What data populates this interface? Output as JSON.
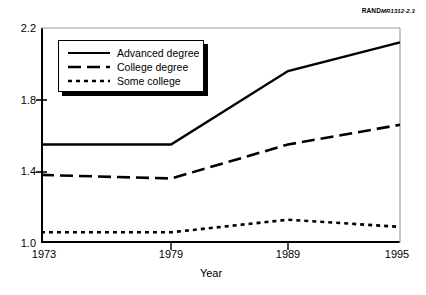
{
  "source_tag": {
    "brand": "RAND",
    "number": "MR1312-2.3"
  },
  "axes": {
    "y_title": "",
    "y_ticks": [
      "1.0",
      "1.4",
      "1.8",
      "2.2"
    ],
    "x_title": "Year",
    "x_ticks": [
      "1973",
      "1979",
      "1989",
      "1995"
    ]
  },
  "legend": {
    "entries": [
      {
        "label": "Advanced degree",
        "style": "solid"
      },
      {
        "label": "College degree",
        "style": "dashed"
      },
      {
        "label": "Some college",
        "style": "dotted"
      }
    ]
  },
  "chart_data": {
    "type": "line",
    "title": "",
    "xlabel": "Year",
    "ylabel": "",
    "x": [
      "1973",
      "1979",
      "1989",
      "1995"
    ],
    "categories": [
      "1973",
      "1979",
      "1989",
      "1995"
    ],
    "ylim": [
      1.0,
      2.2
    ],
    "yticks": [
      1.0,
      1.4,
      1.8,
      2.2
    ],
    "grid": false,
    "legend_position": "upper-left-inside",
    "x_spacing": "categorical-uneven",
    "series": [
      {
        "name": "Advanced degree",
        "style": "solid",
        "values": [
          1.55,
          1.55,
          1.96,
          2.12
        ]
      },
      {
        "name": "College degree",
        "style": "dashed",
        "values": [
          1.38,
          1.36,
          1.55,
          1.66
        ]
      },
      {
        "name": "Some college",
        "style": "dotted",
        "values": [
          1.06,
          1.06,
          1.13,
          1.09
        ]
      }
    ]
  }
}
